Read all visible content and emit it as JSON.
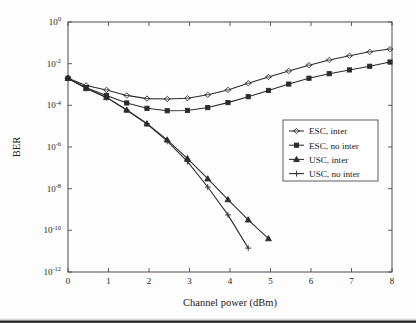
{
  "chart_data": {
    "type": "line",
    "title": "",
    "xlabel": "Channel power (dBm)",
    "ylabel": "BER",
    "xlim": [
      0,
      8
    ],
    "ylim": [
      1e-12,
      1
    ],
    "yscale": "log",
    "xscale": "linear",
    "grid": false,
    "legend_position": "center-right",
    "xticks": [
      "0",
      "1",
      "2",
      "3",
      "4",
      "5",
      "6",
      "7",
      "8"
    ],
    "xtick_values": [
      0,
      1,
      2,
      3,
      4,
      5,
      6,
      7,
      8
    ],
    "yticks": [
      "10^0",
      "10^-2",
      "10^-4",
      "10^-6",
      "10^-8",
      "10^-10",
      "10^-12"
    ],
    "ytick_mantissas": [
      "10",
      "10",
      "10",
      "10",
      "10",
      "10",
      "10"
    ],
    "ytick_exponents": [
      "0",
      "-2",
      "-4",
      "-6",
      "-8",
      "-10",
      "-12"
    ],
    "ytick_values": [
      1,
      0.01,
      0.0001,
      1e-06,
      1e-08,
      1e-10,
      1e-12
    ],
    "series": [
      {
        "name": "ESC, inter",
        "marker": "diamond-open",
        "x": [
          0.0,
          0.45,
          0.95,
          1.45,
          1.95,
          2.45,
          2.95,
          3.45,
          3.95,
          4.45,
          4.95,
          5.45,
          5.95,
          6.45,
          6.95,
          7.45,
          7.95
        ],
        "y": [
          0.002,
          0.0009,
          0.00055,
          0.0003,
          0.00021,
          0.0002,
          0.00022,
          0.00032,
          0.00055,
          0.00115,
          0.0023,
          0.0045,
          0.0085,
          0.015,
          0.024,
          0.037,
          0.05
        ]
      },
      {
        "name": "ESC, no inter",
        "marker": "square-solid",
        "x": [
          0.0,
          0.45,
          0.95,
          1.45,
          1.95,
          2.45,
          2.95,
          3.45,
          3.95,
          4.45,
          4.95,
          5.45,
          5.95,
          6.45,
          6.95,
          7.45,
          7.95
        ],
        "y": [
          0.002,
          0.0007,
          0.0003,
          0.00013,
          7.2e-05,
          5.5e-05,
          5.7e-05,
          7.8e-05,
          0.000135,
          0.00026,
          0.00052,
          0.00105,
          0.002,
          0.0033,
          0.005,
          0.0075,
          0.012
        ]
      },
      {
        "name": "USC, inter",
        "marker": "triangle-solid",
        "x": [
          0.0,
          0.45,
          0.95,
          1.45,
          1.95,
          2.45,
          2.95,
          3.45,
          3.95,
          4.45,
          4.95
        ],
        "y": [
          0.002,
          0.00065,
          0.00024,
          6e-05,
          1.3e-05,
          2.2e-06,
          2.8e-07,
          3e-08,
          3e-09,
          3.2e-10,
          4e-11
        ]
      },
      {
        "name": "USC, no inter",
        "marker": "plus",
        "x": [
          0.0,
          0.45,
          0.95,
          1.45,
          1.95,
          2.45,
          2.95,
          3.45,
          3.95,
          4.45
        ],
        "y": [
          0.002,
          0.00065,
          0.00024,
          6e-05,
          1.3e-05,
          1.9e-06,
          2e-07,
          1.2e-08,
          5.5e-10,
          1.4e-11
        ]
      }
    ]
  },
  "legend": {
    "items": [
      {
        "label": "ESC, inter",
        "marker": "diamond-open"
      },
      {
        "label": "ESC, no inter",
        "marker": "square-solid"
      },
      {
        "label": "USC, inter",
        "marker": "triangle-solid"
      },
      {
        "label": "USC, no inter",
        "marker": "plus"
      }
    ]
  },
  "colors": {
    "line": "#2b2b2b",
    "axis": "#4d4d4d",
    "background": "#fdfdfd",
    "text": "#1a1a1a"
  }
}
